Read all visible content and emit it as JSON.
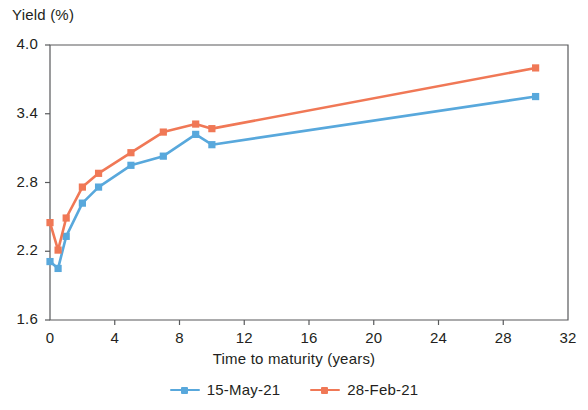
{
  "chart_data": {
    "type": "line",
    "title": "",
    "xlabel": "Time to maturity (years)",
    "ylabel": "Yield (%)",
    "xlim": [
      0,
      32
    ],
    "ylim": [
      1.6,
      4.0
    ],
    "xticks": [
      "0",
      "4",
      "8",
      "12",
      "16",
      "20",
      "24",
      "28",
      "32"
    ],
    "yticks": [
      "1.6",
      "2.2",
      "2.8",
      "3.4",
      "4.0"
    ],
    "grid": false,
    "legend_position": "bottom",
    "marker": "square",
    "x": [
      0,
      0.5,
      1,
      2,
      3,
      5,
      7,
      9,
      10,
      30
    ],
    "series": [
      {
        "name": "15-May-21",
        "color": "#58a8dc",
        "values": [
          2.11,
          2.05,
          2.33,
          2.62,
          2.76,
          2.95,
          3.03,
          3.22,
          3.13,
          3.55
        ]
      },
      {
        "name": "28-Feb-21",
        "color": "#f07856",
        "values": [
          2.45,
          2.21,
          2.49,
          2.76,
          2.88,
          3.06,
          3.24,
          3.31,
          3.27,
          3.8
        ]
      }
    ]
  },
  "legend": {
    "items": [
      {
        "label": "15-May-21",
        "color": "#58a8dc"
      },
      {
        "label": "28-Feb-21",
        "color": "#f07856"
      }
    ]
  },
  "axes": {
    "y_title": "Yield (%)",
    "x_title": "Time to maturity (years)"
  }
}
